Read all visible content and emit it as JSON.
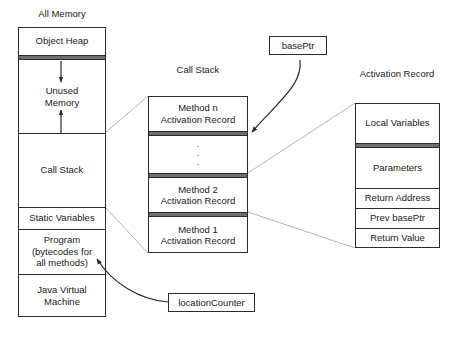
{
  "diagram": {
    "titles": {
      "all_memory": "All Memory",
      "call_stack": "Call Stack",
      "activation_record": "Activation Record"
    },
    "all_memory_sections": [
      {
        "label": "Object Heap"
      },
      {
        "label_line1": "Unused",
        "label_line2": "Memory"
      },
      {
        "label": "Call Stack"
      },
      {
        "label": "Static Variables"
      },
      {
        "label_line1": "Program",
        "label_line2": "(bytecodes for",
        "label_line3": "all methods)"
      },
      {
        "label_line1": "Java Virtual",
        "label_line2": "Machine"
      }
    ],
    "call_stack_sections": [
      {
        "label_line1": "Method n",
        "label_line2": "Activation Record"
      },
      {
        "label": "⋮"
      },
      {
        "label_line1": "Method 2",
        "label_line2": "Activation Record"
      },
      {
        "label_line1": "Method 1",
        "label_line2": "Activation Record"
      }
    ],
    "activation_record_fields": [
      {
        "label": "Local Variables"
      },
      {
        "label": "Parameters"
      },
      {
        "label": "Return Address"
      },
      {
        "label": "Prev basePtr"
      },
      {
        "label": "Return Value"
      }
    ],
    "pointer_tags": [
      {
        "label": "basePtr"
      },
      {
        "label": "locationCounter"
      }
    ],
    "colors": {
      "stroke": "#2b2b2b",
      "connector": "#b4b4b4",
      "divider": "#6e6e6e",
      "background": "#ffffff",
      "text": "#1a1a1a"
    }
  }
}
